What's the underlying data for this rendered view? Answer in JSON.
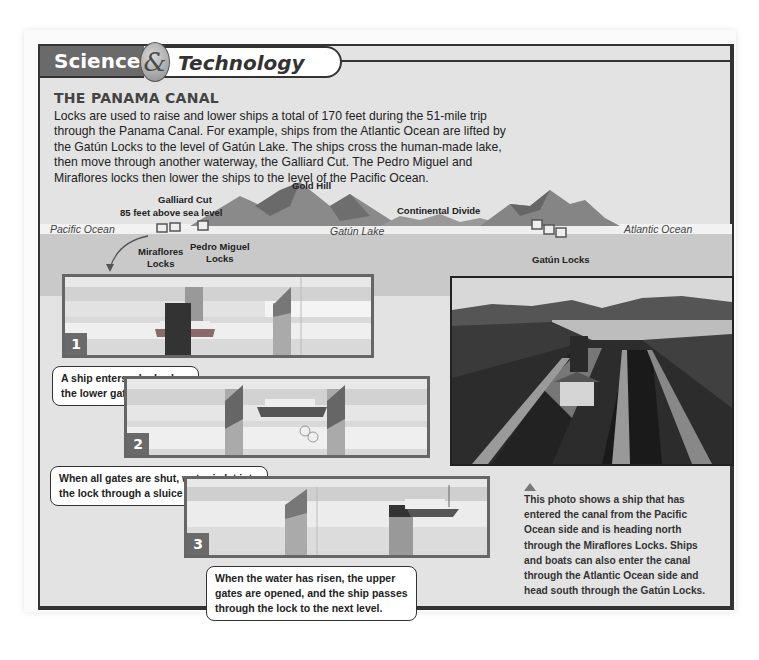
{
  "header": {
    "science_label": "Science",
    "ampersand": "&",
    "technology_label": "Technology"
  },
  "article": {
    "title": "THE PANAMA CANAL",
    "body": "Locks are used to raise and lower ships a total of 170 feet during the 51-mile trip through the Panama Canal. For example, ships from the Atlantic Ocean are lifted by the Gatún Locks to the level of Gatún Lake. The ships cross the human-made lake, then move through another waterway, the Galliard Cut. The Pedro Miguel and Miraflores locks then lower the ships to the level of the Pacific Ocean."
  },
  "profile_diagram": {
    "labels": {
      "gold_hill": "Gold Hill",
      "galliard_cut": "Galliard Cut",
      "galliard_elevation": "85 feet above sea level",
      "continental_divide": "Continental Divide",
      "pacific_ocean": "Pacific Ocean",
      "gatun_lake": "Gatún Lake",
      "atlantic_ocean": "Atlantic Ocean",
      "miraflores_locks_1": "Miraflores",
      "miraflores_locks_2": "Locks",
      "pedro_miguel_locks_1": "Pedro Miguel",
      "pedro_miguel_locks_2": "Locks",
      "gatun_locks": "Gatún Locks"
    }
  },
  "lock_steps": [
    {
      "number": "1",
      "caption_line1": "A ship enters a lock when",
      "caption_line2": "the lower gates are open."
    },
    {
      "number": "2",
      "caption_line1": "When all gates are shut, water is let into",
      "caption_line2": "the lock through a sluice (small gate)."
    },
    {
      "number": "3",
      "caption_line1": "When the water has risen, the upper",
      "caption_line2": "gates are opened, and the ship passes",
      "caption_line3": "through the lock to the next level."
    }
  ],
  "photo": {
    "caption": "This photo shows a ship that has entered the canal from the Pacific Ocean side and is heading north through the Miraflores Locks. Ships and boats can also enter the canal through the Atlantic Ocean side and head south through the Gatún Locks."
  },
  "colors": {
    "frame_border": "#333333",
    "panel_bg": "#e3e3e3",
    "tab_dark": "#6a6a6a",
    "lock_border": "#666666"
  }
}
